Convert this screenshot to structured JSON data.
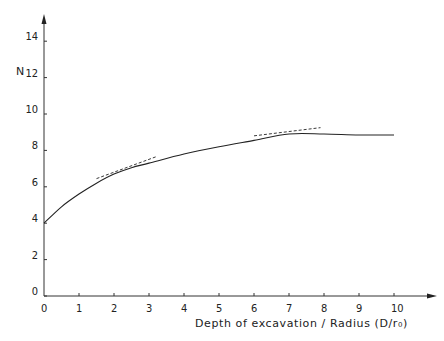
{
  "chart_data": {
    "type": "line",
    "title": "",
    "xlabel": "Depth of excavation / Radius (D/r₀)",
    "ylabel": "N",
    "xlim": [
      0,
      10
    ],
    "ylim": [
      0,
      14
    ],
    "x_ticks": [
      "0",
      "1",
      "2",
      "3",
      "4",
      "5",
      "6",
      "7",
      "8",
      "9",
      "10"
    ],
    "y_ticks": [
      "0",
      "2",
      "4",
      "6",
      "8",
      "10",
      "12",
      "14"
    ],
    "grid": false,
    "legend": null,
    "series": [
      {
        "name": "N vs D/r0",
        "style": "solid",
        "x": [
          0,
          0.5,
          1,
          1.5,
          2,
          2.5,
          3,
          4,
          5,
          6,
          7,
          8,
          9,
          10
        ],
        "y": [
          4.0,
          4.9,
          5.6,
          6.2,
          6.7,
          7.05,
          7.3,
          7.8,
          8.2,
          8.55,
          8.9,
          8.9,
          8.85,
          8.85
        ]
      },
      {
        "name": "tangent at D/r0=2",
        "style": "dashed",
        "x": [
          1.5,
          3.2
        ],
        "y": [
          6.45,
          7.65
        ]
      },
      {
        "name": "tangent at D/r0=7",
        "style": "dashed",
        "x": [
          6.0,
          7.9
        ],
        "y": [
          8.8,
          9.25
        ]
      }
    ]
  }
}
